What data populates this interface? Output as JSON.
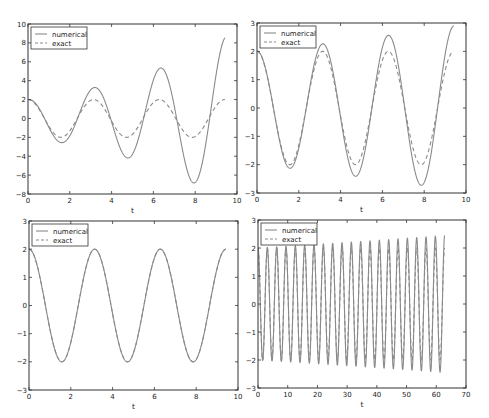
{
  "figure": {
    "width": 489,
    "height": 418,
    "line_color": "#8a8a8a",
    "frame_color": "#333333"
  },
  "chart_data": [
    {
      "type": "line",
      "panel": "top-left",
      "title": "",
      "xlabel": "t",
      "ylabel": "",
      "xlim": [
        0,
        10
      ],
      "ylim": [
        -8,
        10
      ],
      "xticks": [
        0,
        2,
        4,
        6,
        8,
        10
      ],
      "yticks": [
        -8,
        -6,
        -4,
        -2,
        0,
        2,
        4,
        6,
        8,
        10
      ],
      "xtick_labels": [
        "0",
        "2",
        "4",
        "6",
        "8",
        "10"
      ],
      "ytick_labels": [
        "−8",
        "−6",
        "−4",
        "−2",
        "0",
        "2",
        "4",
        "6",
        "8",
        "10"
      ],
      "grid": false,
      "legend": {
        "position": "upper left",
        "entries": [
          "numerical",
          "exact"
        ]
      },
      "t_end": 9.42,
      "series": [
        {
          "name": "numerical",
          "style": "solid",
          "formula": "2*exp(0.155t)*cos(2t - 0.06t)",
          "extrema": [
            [
              0,
              2.0
            ],
            [
              1.6,
              -2.5
            ],
            [
              3.2,
              3.3
            ],
            [
              4.75,
              -4.1
            ],
            [
              6.35,
              5.4
            ],
            [
              7.95,
              -6.7
            ],
            [
              9.42,
              8.6
            ]
          ]
        },
        {
          "name": "exact",
          "style": "dashed",
          "formula": "2*cos(2t)",
          "extrema": [
            [
              0,
              2.0
            ],
            [
              1.57,
              -2.0
            ],
            [
              3.14,
              2.0
            ],
            [
              4.71,
              -2.0
            ],
            [
              6.28,
              2.0
            ],
            [
              7.85,
              -2.0
            ],
            [
              9.42,
              2.0
            ]
          ]
        }
      ]
    },
    {
      "type": "line",
      "panel": "top-right",
      "title": "",
      "xlabel": "t",
      "ylabel": "",
      "xlim": [
        0,
        10
      ],
      "ylim": [
        -3,
        3
      ],
      "xticks": [
        0,
        2,
        4,
        6,
        8,
        10
      ],
      "yticks": [
        -3,
        -2,
        -1,
        0,
        1,
        2,
        3
      ],
      "xtick_labels": [
        "0",
        "2",
        "4",
        "6",
        "8",
        "10"
      ],
      "ytick_labels": [
        "−3",
        "−2",
        "−1",
        "0",
        "1",
        "2",
        "3"
      ],
      "grid": false,
      "legend": {
        "position": "upper left",
        "entries": [
          "numerical",
          "exact"
        ]
      },
      "t_end": 9.42,
      "series": [
        {
          "name": "numerical",
          "style": "solid",
          "formula": "2*exp(0.0395t)*cos(2t)",
          "extrema": [
            [
              0,
              2.0
            ],
            [
              1.57,
              -2.1
            ],
            [
              3.14,
              2.25
            ],
            [
              4.71,
              -2.4
            ],
            [
              6.28,
              2.55
            ],
            [
              7.85,
              -2.7
            ],
            [
              9.42,
              2.9
            ]
          ]
        },
        {
          "name": "exact",
          "style": "dashed",
          "formula": "2*cos(2t)",
          "extrema": [
            [
              0,
              2.0
            ],
            [
              1.57,
              -2.0
            ],
            [
              3.14,
              2.0
            ],
            [
              4.71,
              -2.0
            ],
            [
              6.28,
              2.0
            ],
            [
              7.85,
              -2.0
            ],
            [
              9.42,
              2.0
            ]
          ]
        }
      ]
    },
    {
      "type": "line",
      "panel": "bottom-left",
      "title": "",
      "xlabel": "t",
      "ylabel": "",
      "xlim": [
        0,
        10
      ],
      "ylim": [
        -3,
        3
      ],
      "xticks": [
        0,
        2,
        4,
        6,
        8,
        10
      ],
      "yticks": [
        -3,
        -2,
        -1,
        0,
        1,
        2,
        3
      ],
      "xtick_labels": [
        "0",
        "2",
        "4",
        "6",
        "8",
        "10"
      ],
      "ytick_labels": [
        "−3",
        "−2",
        "−1",
        "0",
        "1",
        "2",
        "3"
      ],
      "grid": false,
      "legend": {
        "position": "upper left",
        "entries": [
          "numerical",
          "exact"
        ]
      },
      "t_end": 9.42,
      "series": [
        {
          "name": "numerical",
          "style": "solid",
          "formula": "2*cos(2t)",
          "extrema": [
            [
              0,
              2.0
            ],
            [
              1.57,
              -2.0
            ],
            [
              3.14,
              2.0
            ],
            [
              4.71,
              -2.0
            ],
            [
              6.28,
              2.0
            ],
            [
              7.85,
              -2.0
            ],
            [
              9.42,
              2.0
            ]
          ]
        },
        {
          "name": "exact",
          "style": "dashed",
          "formula": "2*cos(2t)",
          "extrema": [
            [
              0,
              2.0
            ],
            [
              1.57,
              -2.0
            ],
            [
              3.14,
              2.0
            ],
            [
              4.71,
              -2.0
            ],
            [
              6.28,
              2.0
            ],
            [
              7.85,
              -2.0
            ],
            [
              9.42,
              2.0
            ]
          ]
        }
      ]
    },
    {
      "type": "line",
      "panel": "bottom-right",
      "title": "",
      "xlabel": "t",
      "ylabel": "",
      "xlim": [
        0,
        70
      ],
      "ylim": [
        -3,
        3
      ],
      "xticks": [
        0,
        10,
        20,
        30,
        40,
        50,
        60,
        70
      ],
      "yticks": [
        -3,
        -2,
        -1,
        0,
        1,
        2,
        3
      ],
      "xtick_labels": [
        "0",
        "10",
        "20",
        "30",
        "40",
        "50",
        "60",
        "70"
      ],
      "ytick_labels": [
        "−3",
        "−2",
        "−1",
        "0",
        "1",
        "2",
        "3"
      ],
      "grid": false,
      "legend": {
        "position": "upper left",
        "entries": [
          "numerical",
          "exact"
        ]
      },
      "t_end": 62.83,
      "series": [
        {
          "name": "numerical",
          "style": "solid",
          "formula": "2*exp(0.0032t)*cos(2t)",
          "peak_amplitude_start": 2.0,
          "peak_amplitude_end": 2.45
        },
        {
          "name": "exact",
          "style": "dashed",
          "formula": "2*cos(2t)",
          "peak_amplitude_start": 2.0,
          "peak_amplitude_end": 2.0
        }
      ]
    }
  ],
  "panels": [
    {
      "id": "top-left",
      "frame": {
        "x": 28,
        "y": 24,
        "w": 209,
        "h": 170
      },
      "k": 0.155,
      "phase_drift": 0.012
    },
    {
      "id": "top-right",
      "frame": {
        "x": 257,
        "y": 23,
        "w": 209,
        "h": 170
      },
      "k": 0.0395,
      "phase_drift": 0.0
    },
    {
      "id": "bottom-left",
      "frame": {
        "x": 29,
        "y": 221,
        "w": 209,
        "h": 169
      },
      "k": 0.0,
      "phase_drift": 0.0
    },
    {
      "id": "bottom-right",
      "frame": {
        "x": 258,
        "y": 220,
        "w": 208,
        "h": 168
      },
      "k": 0.0032,
      "phase_drift": 0.0
    }
  ],
  "legend": {
    "numerical_label": "numerical",
    "exact_label": "exact"
  },
  "axis_label": "t"
}
